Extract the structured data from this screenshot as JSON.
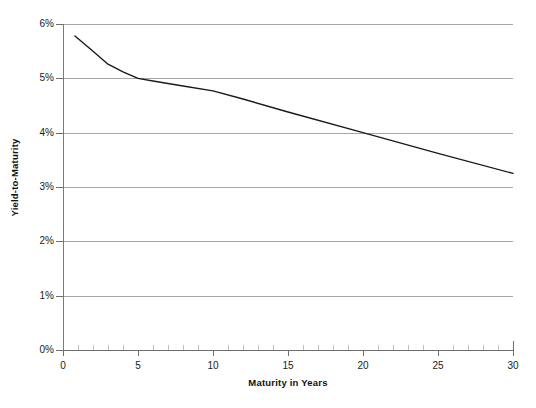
{
  "chart_data": {
    "type": "line",
    "title": "",
    "xlabel": "Maturity in Years",
    "ylabel": "Yield-to-Maturity",
    "xlim": [
      0,
      30
    ],
    "ylim": [
      0,
      6
    ],
    "grid": true,
    "legend": false,
    "y_tick_labels": [
      "0%",
      "1%",
      "2%",
      "3%",
      "4%",
      "5%",
      "6%"
    ],
    "y_tick_values": [
      0,
      1,
      2,
      3,
      4,
      5,
      6
    ],
    "x_tick_labels": [
      "0",
      "5",
      "10",
      "15",
      "20",
      "25",
      "30"
    ],
    "x_tick_values": [
      0,
      5,
      10,
      15,
      20,
      25,
      30
    ],
    "x_minor_tick_step": 1,
    "y_unit": "percent",
    "series": [
      {
        "name": "Yield curve",
        "color": "#1a1a1a",
        "x": [
          0.8,
          2.0,
          3.0,
          4.0,
          5.0,
          6.0,
          8.0,
          10.0,
          12.0,
          15.0,
          20.0,
          25.0,
          30.0
        ],
        "values": [
          5.78,
          5.5,
          5.26,
          5.12,
          5.0,
          4.95,
          4.86,
          4.77,
          4.62,
          4.38,
          4.0,
          3.62,
          3.25
        ]
      }
    ],
    "annotations": []
  },
  "axes": {
    "y_labels": [
      "6%",
      "5%",
      "4%",
      "3%",
      "2%",
      "1%",
      "0%"
    ],
    "x_labels": [
      "0",
      "5",
      "10",
      "15",
      "20",
      "25",
      "30"
    ],
    "x_title": "Maturity in Years",
    "y_title": "Yield-to-Maturity"
  },
  "colors": {
    "background": "#ffffff",
    "gridline": "#a8a8a8",
    "axis": "#6e6e6e",
    "series": "#1a1a1a",
    "text": "#1a1a1a"
  }
}
